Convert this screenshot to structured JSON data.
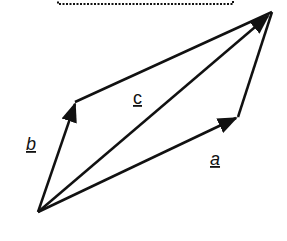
{
  "diagram": {
    "vectors": [
      {
        "name": "a",
        "label": "a",
        "from": [
          38,
          212
        ],
        "to": [
          238,
          117
        ]
      },
      {
        "name": "b",
        "label": "b",
        "from": [
          38,
          212
        ],
        "to": [
          75,
          102
        ]
      },
      {
        "name": "c",
        "label": "c",
        "from": [
          38,
          212
        ],
        "to": [
          272,
          12
        ]
      }
    ],
    "sides": [
      {
        "from": [
          75,
          102
        ],
        "to": [
          272,
          12
        ]
      },
      {
        "from": [
          238,
          117
        ],
        "to": [
          272,
          12
        ]
      }
    ],
    "labels": {
      "a": "a",
      "b": "b",
      "c": "c"
    },
    "colors": {
      "stroke": "#111111",
      "background": "#ffffff"
    }
  }
}
